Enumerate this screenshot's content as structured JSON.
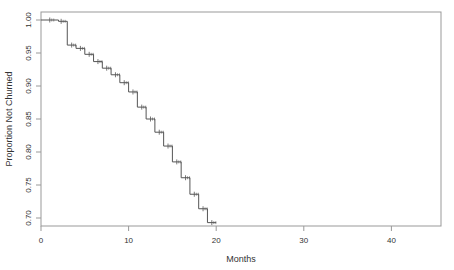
{
  "chart_data": {
    "type": "line",
    "subtype": "kaplan-meier-step",
    "title": "",
    "xlabel": "Months",
    "ylabel": "Proportion Not Churned",
    "xlim": [
      0,
      45
    ],
    "ylim": [
      0.69,
      1.005
    ],
    "x_ticks": [
      0,
      10,
      20,
      30,
      40
    ],
    "y_ticks": [
      0.7,
      0.75,
      0.8,
      0.85,
      0.9,
      0.95,
      1.0
    ],
    "y_tick_labels": [
      "0.70",
      "0.75",
      "0.80",
      "0.85",
      "0.90",
      "0.95",
      "1.00"
    ],
    "grid": false,
    "legend": null,
    "series": [
      {
        "name": "survival",
        "color": "#555555",
        "steps": [
          {
            "x": 0,
            "y": 1.0
          },
          {
            "x": 2,
            "y": 0.998
          },
          {
            "x": 3,
            "y": 0.962
          },
          {
            "x": 4,
            "y": 0.957
          },
          {
            "x": 5,
            "y": 0.948
          },
          {
            "x": 6,
            "y": 0.937
          },
          {
            "x": 7,
            "y": 0.927
          },
          {
            "x": 8,
            "y": 0.917
          },
          {
            "x": 9,
            "y": 0.905
          },
          {
            "x": 10,
            "y": 0.891
          },
          {
            "x": 11,
            "y": 0.868
          },
          {
            "x": 12,
            "y": 0.85
          },
          {
            "x": 13,
            "y": 0.83
          },
          {
            "x": 14,
            "y": 0.809
          },
          {
            "x": 15,
            "y": 0.785
          },
          {
            "x": 16,
            "y": 0.761
          },
          {
            "x": 17,
            "y": 0.736
          },
          {
            "x": 18,
            "y": 0.714
          },
          {
            "x": 19,
            "y": 0.693
          },
          {
            "x": 20,
            "y": 0.693
          }
        ],
        "censor_marks": [
          1,
          2.3,
          3.5,
          4.5,
          5.5,
          6.5,
          7.5,
          8.5,
          9.5,
          10.5,
          11.5,
          12.5,
          13.5,
          14.5,
          15.5,
          16.5,
          17.5,
          18.5,
          19.5
        ]
      }
    ]
  }
}
